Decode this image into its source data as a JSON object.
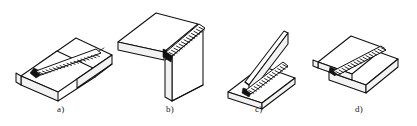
{
  "figure": {
    "background_color": "#ffffff",
    "line_color": "#111111",
    "shade_color": "#f2f2f2",
    "width": 417,
    "height": 126,
    "items": [
      {
        "id": "a",
        "label": "a)",
        "joint_name": "butt-joint",
        "description": "Two flat plates joined edge to edge with a straight weld bead along the seam",
        "caption_x": 57,
        "caption_y": 104
      },
      {
        "id": "b",
        "label": "b)",
        "joint_name": "corner-joint",
        "description": "Two plates meeting at a right angle with a weld bead along the outer corner",
        "caption_x": 166,
        "caption_y": 104
      },
      {
        "id": "c",
        "label": "c)",
        "joint_name": "tee-joint",
        "description": "Vertical plate welded perpendicular to a horizontal plate with a fillet weld",
        "caption_x": 255,
        "caption_y": 104
      },
      {
        "id": "d",
        "label": "d)",
        "joint_name": "lap-joint",
        "description": "Two overlapping plates joined with a weld bead along the overlap edge",
        "caption_x": 355,
        "caption_y": 104
      }
    ]
  }
}
